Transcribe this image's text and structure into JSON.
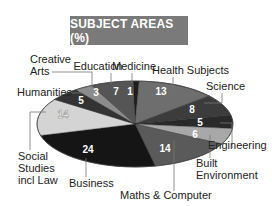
{
  "chart_data": {
    "type": "pie",
    "title": "SUBJECT AREAS (%)",
    "categories": [
      "Medicine",
      "Health Subjects",
      "Science",
      "Engineering",
      "Built Environment",
      "Maths & Computer",
      "Business",
      "Social Studies incl Law",
      "Humanities",
      "Creative Arts",
      "Education"
    ],
    "values": [
      1,
      13,
      8,
      5,
      6,
      14,
      24,
      14,
      5,
      3,
      7
    ],
    "colors": [
      "#1e1e1e",
      "#6e6e6e",
      "#3c3c3c",
      "#2a2a2a",
      "#a8a8a8",
      "#5a5a5a",
      "#151515",
      "#d4d4d4",
      "#333333",
      "#8c8c8c",
      "#555555"
    ],
    "xlabel": "",
    "ylabel": "",
    "legend": "none (direct leader-line labels)"
  },
  "labels": {
    "title": "SUBJECT AREAS (%)",
    "medicine": "Medicine",
    "health": "Health Subjects",
    "science": "Science",
    "engineering": "Engineering",
    "built_1": "Built",
    "built_2": "Environment",
    "maths": "Maths & Computer",
    "business": "Business",
    "social_1": "Social",
    "social_2": "Studies",
    "social_3": "incl Law",
    "humanities": "Humanities",
    "creative_1": "Creative",
    "creative_2": "Arts",
    "education": "Education"
  },
  "values_text": {
    "medicine": "1",
    "health": "13",
    "science": "8",
    "engineering": "5",
    "built": "6",
    "maths": "14",
    "business": "24",
    "social": "14",
    "humanities": "5",
    "creative": "3",
    "education": "7"
  }
}
